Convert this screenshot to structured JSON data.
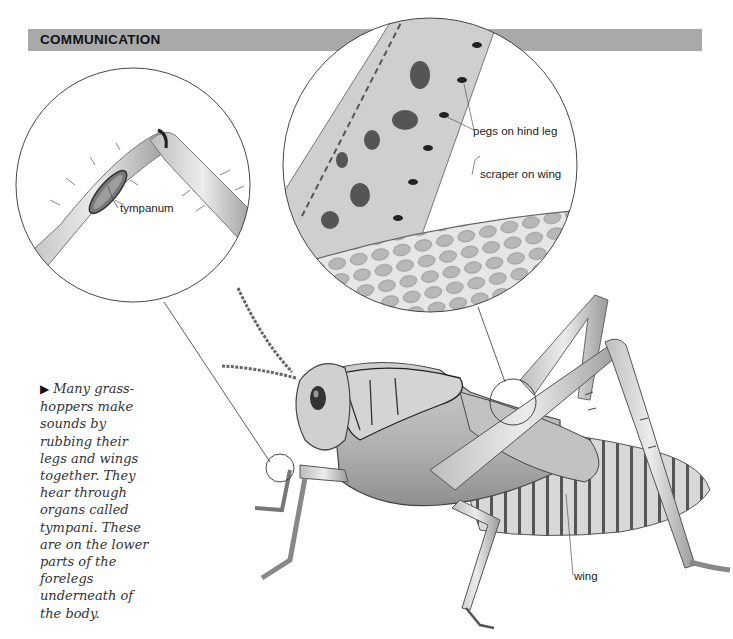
{
  "header": {
    "title": "COMMUNICATION",
    "bar_color": "#a9a9a9"
  },
  "labels": {
    "tympanum": "tympanum",
    "pegs": "pegs on hind leg",
    "scraper": "scraper on wing",
    "wing": "wing"
  },
  "caption": {
    "bullet_icon": "triangle-right-icon",
    "bullet": "▶",
    "text": "Many grass-hoppers make sounds by rubbing their legs and wings together. They hear through organs called tympani. These are on the lower parts of the forelegs underneath of the body."
  },
  "illustration": {
    "subject": "grasshopper",
    "insets": [
      {
        "name": "tympanum-inset",
        "detail": "foreleg joint with tympanum"
      },
      {
        "name": "stridulation-inset",
        "detail": "pegs on hind leg and scraper on wing"
      }
    ]
  }
}
